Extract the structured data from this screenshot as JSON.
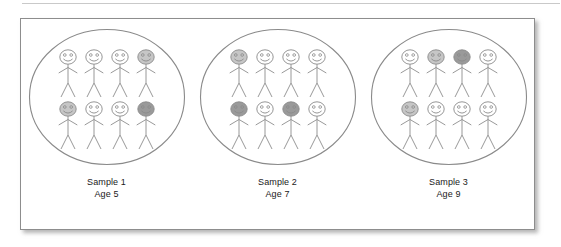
{
  "figure": {
    "type": "sampling-illustration-diagram",
    "frame": {
      "border_color": "#8d8d8d",
      "background_color": "#ffffff",
      "shadow_color": "#787878"
    },
    "oval": {
      "stroke_color": "#8a8a8a",
      "fill_color": "#ffffff",
      "shape": "ellipse"
    },
    "figure_style": {
      "line_color": "#8d8d8d",
      "head_outline_color": "#8a8a8a",
      "face_feature_color": "#8a8a8a",
      "shade_none": "#ffffff",
      "shade_light": "#c6c6c6",
      "shade_dark": "#9a9a9a"
    },
    "groups": [
      {
        "id": "sample-1",
        "caption_name": "Sample 1",
        "caption_age": "Age 5",
        "count": 8,
        "rows": [
          [
            {
              "shade": "none"
            },
            {
              "shade": "none"
            },
            {
              "shade": "none"
            },
            {
              "shade": "light"
            }
          ],
          [
            {
              "shade": "light"
            },
            {
              "shade": "none"
            },
            {
              "shade": "none"
            },
            {
              "shade": "dark"
            }
          ]
        ],
        "shaded_count": 3
      },
      {
        "id": "sample-2",
        "caption_name": "Sample 2",
        "caption_age": "Age 7",
        "count": 8,
        "rows": [
          [
            {
              "shade": "light"
            },
            {
              "shade": "none"
            },
            {
              "shade": "none"
            },
            {
              "shade": "none"
            }
          ],
          [
            {
              "shade": "dark"
            },
            {
              "shade": "none"
            },
            {
              "shade": "dark"
            },
            {
              "shade": "none"
            }
          ]
        ],
        "shaded_count": 3
      },
      {
        "id": "sample-3",
        "caption_name": "Sample 3",
        "caption_age": "Age 9",
        "count": 8,
        "rows": [
          [
            {
              "shade": "none"
            },
            {
              "shade": "light"
            },
            {
              "shade": "dark"
            },
            {
              "shade": "none"
            }
          ],
          [
            {
              "shade": "light"
            },
            {
              "shade": "none"
            },
            {
              "shade": "none"
            },
            {
              "shade": "none"
            }
          ]
        ],
        "shaded_count": 3
      }
    ]
  }
}
